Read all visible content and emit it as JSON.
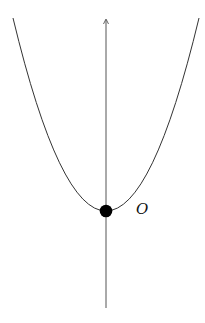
{
  "diagram": {
    "type": "parabola",
    "axis": {
      "label": "",
      "direction": "up"
    },
    "vertex": {
      "label": "O"
    },
    "colors": {
      "curve": "#333333",
      "axis": "#555555",
      "point": "#000000",
      "background": "#ffffff"
    }
  }
}
